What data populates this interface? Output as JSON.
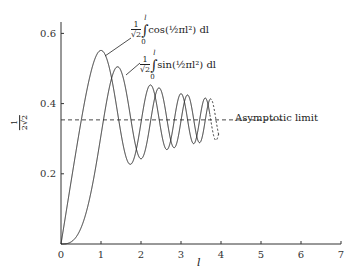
{
  "chart_data": {
    "type": "line",
    "title": "",
    "xlabel": "l",
    "ylabel": "1/(2√2)",
    "xlim": [
      0,
      7
    ],
    "ylim": [
      0,
      0.6
    ],
    "x_ticks": [
      "0",
      "1",
      "2",
      "3",
      "4",
      "5",
      "6",
      "7"
    ],
    "y_ticks": [
      "0.2",
      "0.4",
      "0.6"
    ],
    "grid": false,
    "series": [
      {
        "name": "(1/√2)∫₀ˡ cos(½πl²) dl",
        "function": "fresnel_C_over_sqrt2",
        "x_range": [
          0,
          3.95
        ],
        "peaks": [
          {
            "x": 1.0,
            "y": 0.552
          },
          {
            "x": 2.24,
            "y": 0.45
          },
          {
            "x": 3.0,
            "y": 0.432
          }
        ]
      },
      {
        "name": "(1/√2)∫₀ˡ sin(½πl²) dl",
        "function": "fresnel_S_over_sqrt2",
        "x_range": [
          0,
          3.95
        ],
        "peaks": [
          {
            "x": 1.41,
            "y": 0.507
          },
          {
            "x": 2.45,
            "y": 0.439
          }
        ]
      }
    ],
    "reference_lines": [
      {
        "label": "Asymptotic limit",
        "y": 0.3536,
        "style": "dashed",
        "x_range": [
          0,
          5.6
        ]
      }
    ]
  },
  "labels": {
    "x_axis": "l",
    "y_axis_num": "1",
    "y_axis_den": "2√2",
    "asymptote": "Asymptotic limit",
    "cos_label": {
      "num": "1",
      "den": "√2",
      "upper": "l",
      "lower": "0",
      "body": "cos(½πl²) dl"
    },
    "sin_label": {
      "num": "1",
      "den": "√2",
      "upper": "l",
      "lower": "0",
      "body": "sin(½πl²) dl"
    }
  }
}
